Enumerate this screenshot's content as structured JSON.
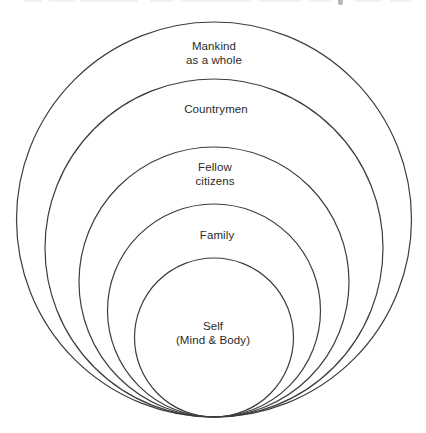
{
  "diagram": {
    "background_color": "#ffffff",
    "stroke_color": "#3d3d3d",
    "text_color": "#2b2b2b",
    "center_x": 214,
    "bottom_tangent_y": 417,
    "rings": [
      {
        "id": "mankind",
        "label_lines": [
          "Mankind",
          "as a whole"
        ],
        "radius": 197.5,
        "center_y": 219.5,
        "label_x": 214,
        "label_y": 53
      },
      {
        "id": "countrymen",
        "label_lines": [
          "Countrymen"
        ],
        "radius": 169,
        "center_y": 248,
        "label_x": 216,
        "label_y": 110
      },
      {
        "id": "fellow-citizens",
        "label_lines": [
          "Fellow",
          "citizens"
        ],
        "radius": 135,
        "center_y": 282,
        "label_x": 215,
        "label_y": 174
      },
      {
        "id": "family",
        "label_lines": [
          "Family"
        ],
        "radius": 106.5,
        "center_y": 310.5,
        "label_x": 217,
        "label_y": 236
      },
      {
        "id": "self",
        "label_lines": [
          "Self",
          "(Mind & Body)"
        ],
        "radius": 79.5,
        "center_y": 337.5,
        "label_x": 213,
        "label_y": 333
      }
    ],
    "artifact_dashes": [
      {
        "x": 24,
        "w": 18
      },
      {
        "x": 49,
        "w": 27
      },
      {
        "x": 80,
        "w": 58
      },
      {
        "x": 150,
        "w": 23
      },
      {
        "x": 181,
        "w": 70
      },
      {
        "x": 259,
        "w": 42
      },
      {
        "x": 309,
        "w": 22
      },
      {
        "x": 355,
        "w": 26
      },
      {
        "x": 390,
        "w": 21
      }
    ]
  }
}
